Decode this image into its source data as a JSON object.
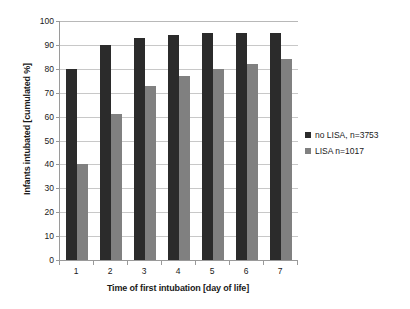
{
  "chart_data": {
    "type": "bar",
    "title": "",
    "subtitle": "",
    "xlabel": "Time of first intubation [day of life]",
    "ylabel": "Infants intubated [cumulated %]",
    "categories": [
      "1",
      "2",
      "3",
      "4",
      "5",
      "6",
      "7"
    ],
    "series": [
      {
        "name": "no LISA, n=3753",
        "color": "#2b2b2b",
        "values": [
          80,
          90,
          93,
          94,
          95,
          95,
          95
        ]
      },
      {
        "name": "LISA n=1017",
        "color": "#808080",
        "values": [
          40,
          61,
          73,
          77,
          80,
          82,
          84
        ]
      }
    ],
    "ylim": [
      0,
      100
    ],
    "yticks": [
      0,
      10,
      20,
      30,
      40,
      50,
      60,
      70,
      80,
      90,
      100
    ],
    "ytick_labels": [
      "0",
      "10",
      "20",
      "30",
      "40",
      "50",
      "60",
      "70",
      "80",
      "90",
      "100"
    ],
    "grid": "horizontal",
    "legend_position": "right",
    "legend_entries": [
      "no LISA, n=3753",
      "LISA n=1017"
    ]
  }
}
